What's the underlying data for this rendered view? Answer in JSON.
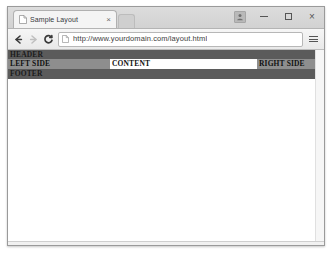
{
  "window": {
    "controls": {
      "profile_label": "",
      "minimize_label": "",
      "maximize_label": "",
      "close_label": "×"
    }
  },
  "tabs": [
    {
      "title": "Sample Layout",
      "favicon": "page-icon",
      "close_label": "×",
      "active": true
    }
  ],
  "toolbar": {
    "back_label": "←",
    "forward_label": "→",
    "reload_label": "C",
    "menu_label": "menu-icon",
    "omnibox": {
      "url": "http://www.yourdomain.com/layout.html",
      "placeholder": "Search or type URL",
      "page_icon": "document-icon"
    }
  },
  "page": {
    "header": "HEADER",
    "left_side": "LEFT SIDE",
    "content": "CONTENT",
    "right_side": "RIGHT SIDE",
    "footer": "FOOTER"
  },
  "colors": {
    "header_bg": "#5b5b5b",
    "footer_bg": "#5b5b5b",
    "side_bg": "#8e8e8e",
    "content_bg": "#ffffff",
    "page_bg": "#ffffff",
    "chrome_bg": "#f1f1f1"
  }
}
